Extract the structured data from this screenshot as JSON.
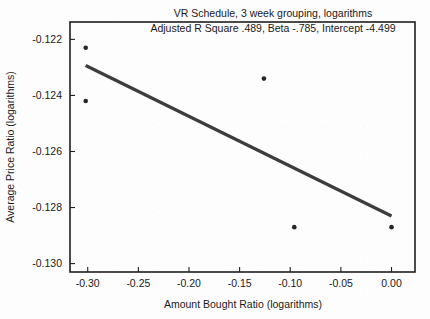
{
  "chart_data": {
    "type": "scatter",
    "title": "VR Schedule, 3 week grouping, logarithms",
    "subtitle": "Adjusted R Square .489, Beta -.785, Intercept -4.499",
    "xlabel": "Amount Bought Ratio (logarithms)",
    "ylabel": "Average Price Ratio (logarithms)",
    "xlim": [
      -0.3175,
      0.0232
    ],
    "ylim": [
      -0.1303,
      -0.12138
    ],
    "grid": false,
    "legend": null,
    "xticks": [
      -0.3,
      -0.25,
      -0.2,
      -0.15,
      -0.1,
      -0.05,
      0.0
    ],
    "xticklabels": [
      "-0.30",
      "-0.25",
      "-0.20",
      "-0.15",
      "-0.10",
      "-0.05",
      "0.00"
    ],
    "yticks": [
      -0.122,
      -0.124,
      -0.126,
      -0.128,
      -0.13
    ],
    "yticklabels": [
      "-0.122",
      "-0.124",
      "-0.126",
      "-0.128",
      "-0.130"
    ],
    "points": [
      {
        "x": -0.302,
        "y": -0.1223
      },
      {
        "x": -0.302,
        "y": -0.1242
      },
      {
        "x": -0.126,
        "y": -0.1234
      },
      {
        "x": -0.096,
        "y": -0.1287
      },
      {
        "x": 0.0,
        "y": -0.1287
      }
    ],
    "fit_line": {
      "label": "regression-line",
      "x0": -0.302,
      "y0": -0.12293,
      "x1": 0.0,
      "y1": -0.1283,
      "slope": -0.785,
      "intercept": -4.499,
      "adjusted_r_square": 0.489
    },
    "colors": {
      "marker": "#262626",
      "line": "#3d3d3d",
      "axis": "#1f1f1f",
      "background": "#fdfdfd",
      "text": "#1a1a1a"
    }
  }
}
